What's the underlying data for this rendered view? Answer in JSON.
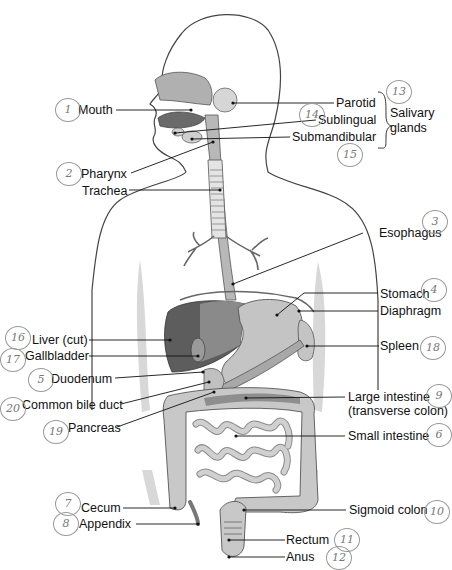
{
  "diagram": {
    "labels": {
      "mouth": "Mouth",
      "pharynx": "Pharynx",
      "trachea": "Trachea",
      "parotid": "Parotid",
      "sublingual": "Sublingual",
      "submandibular": "Submandibular",
      "salivary_glands_line1": "Salivary",
      "salivary_glands_line2": "glands",
      "esophagus": "Esophagus",
      "stomach": "Stomach",
      "diaphragm": "Diaphragm",
      "liver": "Liver (cut)",
      "gallbladder": "Gallbladder",
      "spleen": "Spleen",
      "duodenum": "Duodenum",
      "common_bile_duct": "Common bile duct",
      "pancreas": "Pancreas",
      "large_intestine_line1": "Large intestine",
      "large_intestine_line2": "(transverse colon)",
      "small_intestine": "Small intestine",
      "cecum": "Cecum",
      "appendix": "Appendix",
      "sigmoid_colon": "Sigmoid colon",
      "rectum": "Rectum",
      "anus": "Anus"
    },
    "handwritten_numbers": {
      "mouth": "1",
      "pharynx": "2",
      "esophagus": "3",
      "stomach": "4",
      "duodenum": "5",
      "small_intestine": "6",
      "cecum": "7",
      "appendix": "8",
      "large_intestine": "9",
      "sigmoid_colon": "10",
      "rectum": "11",
      "anus": "12",
      "parotid": "13",
      "sublingual": "14",
      "submandibular": "15",
      "liver": "16",
      "gallbladder": "17",
      "spleen": "18",
      "pancreas": "19",
      "common_bile_duct": "20"
    },
    "colors": {
      "outline": "#444444",
      "organ_light": "#c9c9c9",
      "organ_mid": "#a8a8a8",
      "organ_dark": "#6a6a6a",
      "body_shadow": "#d8d8d8",
      "leader": "#111111"
    }
  }
}
